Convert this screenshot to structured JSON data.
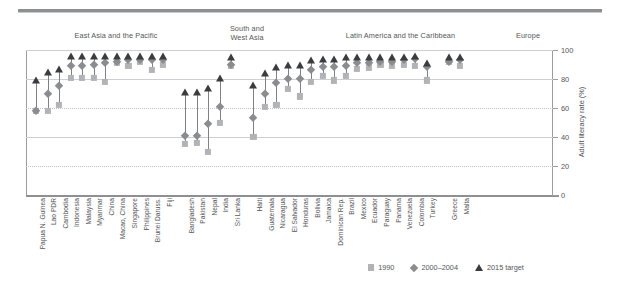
{
  "chart_data": {
    "type": "scatter",
    "title": "",
    "xlabel": "",
    "ylabel": "Adult literacy rate (%)",
    "ylim": [
      0,
      100
    ],
    "yticks": [
      0,
      20,
      40,
      60,
      80,
      100
    ],
    "grid": true,
    "legend_position": "bottom-right",
    "series": [
      {
        "name": "1990",
        "marker": "square",
        "color": "#b1b3b6"
      },
      {
        "name": "2000–2004",
        "marker": "diamond",
        "color": "#8a8c8f"
      },
      {
        "name": "2015 target",
        "marker": "triangle",
        "color": "#3b3c3e"
      }
    ],
    "groups": [
      {
        "label": "East Asia and the Pacific",
        "count": 12
      },
      {
        "label": "South and\nWest Asia",
        "count": 5
      },
      {
        "label": "Latin America and the Caribbean",
        "count": 16
      },
      {
        "label": "Europe",
        "count": 3
      }
    ],
    "categories": [
      "Papua N. Guinea",
      "Lao PDR",
      "Cambodia",
      "Indonesia",
      "Malaysia",
      "Myanmar",
      "China",
      "Macao, China",
      "Singapore",
      "Philippines",
      "Brunei Daruss.",
      "Fiji",
      "Bangladesh",
      "Pakistan",
      "Nepal",
      "India",
      "Sri Lanka",
      "Haiti",
      "Guatemala",
      "Nicaragua",
      "El Salvador",
      "Honduras",
      "Bolivia",
      "Jamaica",
      "Dominican Rep.",
      "Brazil",
      "Mexico",
      "Ecuador",
      "Paraguay",
      "Panama",
      "Venezuela",
      "Colombia",
      "Turkey",
      "Greece",
      "Malta"
    ],
    "values_1990": [
      58,
      58,
      62,
      81,
      81,
      81,
      78,
      91,
      89,
      92,
      86,
      90,
      35,
      36,
      30,
      50,
      89,
      40,
      61,
      62,
      73,
      68,
      78,
      82,
      79,
      82,
      87,
      88,
      90,
      89,
      90,
      89,
      79,
      92,
      89
    ],
    "values_2000_2004": [
      58,
      70,
      75,
      89,
      89,
      90,
      91,
      92,
      93,
      93,
      93,
      93,
      41,
      41,
      49,
      61,
      90,
      53,
      70,
      77,
      80,
      80,
      86,
      88,
      88,
      89,
      91,
      91,
      92,
      92,
      93,
      94,
      88,
      92,
      93
    ],
    "values_2015_target": [
      79,
      85,
      87,
      96,
      96,
      96,
      96,
      96,
      96,
      96,
      96,
      96,
      71,
      71,
      74,
      81,
      95,
      76,
      84,
      88,
      90,
      90,
      93,
      94,
      94,
      95,
      95,
      95,
      95,
      95,
      95,
      96,
      91,
      95,
      95
    ]
  },
  "axis": {
    "y_title": "Adult literacy rate (%)",
    "ticks": [
      "0",
      "20",
      "40",
      "60",
      "80",
      "100"
    ]
  },
  "legend": {
    "items": [
      {
        "label": "1990"
      },
      {
        "label": "2000–2004"
      },
      {
        "label": "2015 target"
      }
    ]
  },
  "groups": {
    "east_asia": "East Asia and the Pacific",
    "south_west_asia": "South and\nWest Asia",
    "latin_america": "Latin America and the Caribbean",
    "europe": "Europe"
  }
}
